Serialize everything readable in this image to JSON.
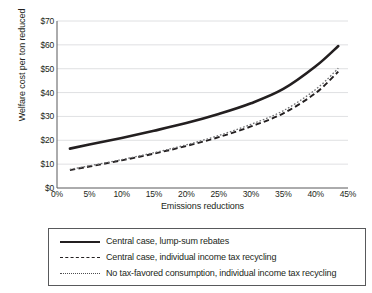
{
  "chart_data": {
    "type": "line",
    "title": "",
    "xlabel": "Emissions reductions",
    "ylabel": "Welfare cost per ton reduced",
    "xlim": [
      0,
      45
    ],
    "ylim": [
      0,
      70
    ],
    "xticks": [
      "0%",
      "5%",
      "10%",
      "15%",
      "20%",
      "25%",
      "30%",
      "35%",
      "40%",
      "45%"
    ],
    "xtick_values": [
      0,
      5,
      10,
      15,
      20,
      25,
      30,
      35,
      40,
      45
    ],
    "yticks": [
      "$0",
      "$10",
      "$20",
      "$30",
      "$40",
      "$50",
      "$60",
      "$70"
    ],
    "ytick_values": [
      0,
      10,
      20,
      30,
      40,
      50,
      60,
      70
    ],
    "grid": "horizontal",
    "legend_position": "below-plot",
    "x": [
      2,
      5,
      10,
      15,
      20,
      25,
      30,
      35,
      40,
      43.5
    ],
    "series": [
      {
        "name": "Central case, lump-sum rebates",
        "style": "solid",
        "color": "#231f20",
        "values": [
          16.5,
          18.2,
          21.0,
          24.0,
          27.2,
          31.0,
          35.5,
          41.5,
          51.0,
          59.5
        ]
      },
      {
        "name": "Central case, individual income tax recycling",
        "style": "dashed",
        "color": "#231f20",
        "values": [
          7.5,
          9.0,
          11.6,
          14.4,
          17.6,
          21.3,
          25.8,
          31.3,
          39.8,
          48.8
        ]
      },
      {
        "name": "No tax-favored consumption, individual income tax recycling",
        "style": "dotted",
        "color": "#6d6e71",
        "values": [
          7.8,
          9.3,
          11.9,
          14.8,
          18.1,
          22.0,
          26.7,
          32.4,
          41.3,
          50.2
        ]
      }
    ]
  },
  "legend": {
    "items": [
      {
        "label": "Central case, lump-sum rebates",
        "style": "solid"
      },
      {
        "label": "Central case, individual income tax recycling",
        "style": "dashed"
      },
      {
        "label": "No tax-favored consumption, individual income tax recycling",
        "style": "dotted"
      }
    ]
  },
  "colors": {
    "axis": "#58595b",
    "grid": "#d7d8da",
    "series_dark": "#231f20",
    "series_gray": "#6d6e71",
    "legend_border": "#58595b"
  }
}
